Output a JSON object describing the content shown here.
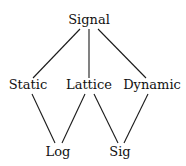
{
  "diagram": {
    "type": "hierarchy",
    "nodes": [
      {
        "id": "signal",
        "label": "Signal",
        "x": 89,
        "y": 24
      },
      {
        "id": "static",
        "label": "Static",
        "x": 28,
        "y": 89
      },
      {
        "id": "lattice",
        "label": "Lattice",
        "x": 89,
        "y": 89
      },
      {
        "id": "dynamic",
        "label": "Dynamic",
        "x": 152,
        "y": 89
      },
      {
        "id": "log",
        "label": "Log",
        "x": 58,
        "y": 156
      },
      {
        "id": "sig",
        "label": "Sig",
        "x": 120,
        "y": 156
      }
    ],
    "edges": [
      {
        "from": "signal",
        "to": "static",
        "x1": 80,
        "y1": 29,
        "x2": 33,
        "y2": 78
      },
      {
        "from": "signal",
        "to": "lattice",
        "x1": 89,
        "y1": 29,
        "x2": 89,
        "y2": 78
      },
      {
        "from": "signal",
        "to": "dynamic",
        "x1": 98,
        "y1": 29,
        "x2": 146,
        "y2": 78
      },
      {
        "from": "static",
        "to": "log",
        "x1": 32,
        "y1": 94,
        "x2": 55,
        "y2": 143
      },
      {
        "from": "lattice",
        "to": "log",
        "x1": 85,
        "y1": 94,
        "x2": 62,
        "y2": 143
      },
      {
        "from": "lattice",
        "to": "sig",
        "x1": 94,
        "y1": 94,
        "x2": 118,
        "y2": 143
      },
      {
        "from": "dynamic",
        "to": "sig",
        "x1": 148,
        "y1": 94,
        "x2": 124,
        "y2": 143
      }
    ]
  }
}
